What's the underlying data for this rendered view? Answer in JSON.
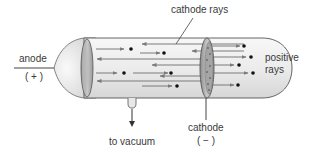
{
  "diagram": {
    "labels": {
      "cathode_rays": "cathode rays",
      "anode": "anode",
      "anode_sign": "( + )",
      "positive_rays_line1": "positive",
      "positive_rays_line2": "rays",
      "to_vacuum": "to vacuum",
      "cathode": "cathode",
      "cathode_sign": "( − )"
    },
    "colors": {
      "tube_outline": "#555555",
      "tube_fill": "#efefef",
      "arrow": "#7a7a7a",
      "particle": "#111111",
      "text": "#3a3a3a"
    }
  }
}
